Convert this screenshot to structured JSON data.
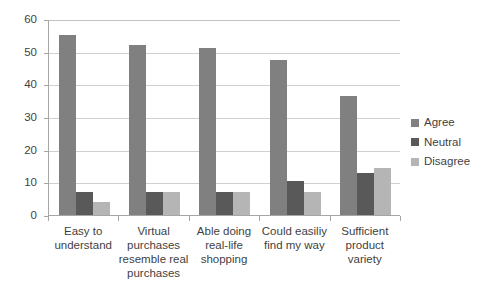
{
  "chart_data": {
    "type": "bar",
    "title": "",
    "subtitle": "",
    "xlabel": "",
    "ylabel": "",
    "ylim": [
      0,
      60
    ],
    "yticks": [
      0,
      10,
      20,
      30,
      40,
      50,
      60
    ],
    "grid": true,
    "legend_position": "right",
    "categories": [
      "Easy to understand",
      "Virtual purchases resemble real purchases",
      "Able doing real-life shopping",
      "Could easiliy find my way",
      "Sufficient product variety"
    ],
    "category_lines": [
      [
        "Easy to",
        "understand"
      ],
      [
        "Virtual",
        "purchases",
        "resemble real",
        "purchases"
      ],
      [
        "Able doing",
        "real-life",
        "shopping"
      ],
      [
        "Could easiliy",
        "find my way"
      ],
      [
        "Sufficient",
        "product variety"
      ]
    ],
    "series": [
      {
        "name": "Agree",
        "color": "#808080",
        "values": [
          55,
          52,
          51,
          47.5,
          36.5
        ]
      },
      {
        "name": "Neutral",
        "color": "#595959",
        "values": [
          7,
          7,
          7,
          10.5,
          13
        ]
      },
      {
        "name": "Disagree",
        "color": "#b5b5b5",
        "values": [
          4,
          7,
          7,
          7,
          14.5
        ]
      }
    ]
  },
  "axis": {
    "y_tick_labels": [
      "60",
      "50",
      "40",
      "30",
      "20",
      "10",
      "0"
    ]
  },
  "legend": {
    "items": [
      {
        "label": "Agree"
      },
      {
        "label": "Neutral"
      },
      {
        "label": "Disagree"
      }
    ]
  }
}
